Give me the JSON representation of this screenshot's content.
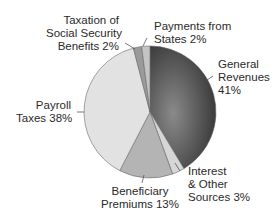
{
  "chart_data": {
    "type": "pie",
    "title": "",
    "start_angle_deg": 0,
    "direction": "clockwise",
    "slices": [
      {
        "label": "General Revenues",
        "value": 41,
        "color": "#4a4a4a"
      },
      {
        "label": "Interest & Other Sources",
        "value": 3,
        "color": "#d6d6d6"
      },
      {
        "label": "Beneficiary Premiums",
        "value": 13,
        "color": "#b4b4b4"
      },
      {
        "label": "Payroll Taxes",
        "value": 38,
        "color": "#e2e2e2"
      },
      {
        "label": "Taxation of Social Security Benefits",
        "value": 2,
        "color": "#9a9a9a"
      },
      {
        "label": "Payments from States",
        "value": 2,
        "color": "#c4c4c4"
      }
    ],
    "legend": "none (direct labels)"
  },
  "labels": {
    "general_revenues": [
      "General",
      "Revenues",
      "41%"
    ],
    "interest": [
      "Interest",
      "& Other",
      "Sources 3%"
    ],
    "beneficiary": [
      "Beneficiary",
      "Premiums 13%"
    ],
    "payroll": [
      "Payroll",
      "Taxes 38%"
    ],
    "taxation": [
      "Taxation of",
      "Social Security",
      "Benefits 2%"
    ],
    "payments": [
      "Payments from",
      "States 2%"
    ]
  }
}
